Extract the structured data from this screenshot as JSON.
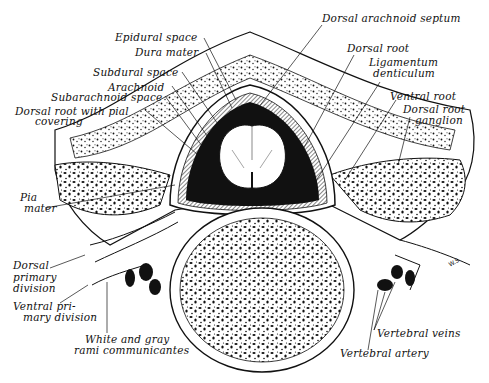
{
  "figure": {
    "signature": "W.S.",
    "colors": {
      "ink": "#111111",
      "paper": "#ffffff"
    }
  },
  "labels": {
    "epidural_space": "Epidural space",
    "dura_mater": "Dura mater",
    "subdural_space": "Subdural space",
    "arachnoid": "Arachnoid",
    "subarachnoid_space": "Subarachnoid space",
    "dorsal_root_pial_1": "Dorsal root with pial",
    "dorsal_root_pial_2": "covering",
    "pia_mater_1": "Pia",
    "pia_mater_2": "mater",
    "dorsal_primary_1": "Dorsal",
    "dorsal_primary_2": "primary",
    "dorsal_primary_3": "division",
    "ventral_primary_1": "Ventral pri-",
    "ventral_primary_2": "mary division",
    "rami_1": "White and gray",
    "rami_2": "rami communicantes",
    "dorsal_arachnoid_septum": "Dorsal arachnoid septum",
    "dorsal_root": "Dorsal root",
    "ligamentum_1": "Ligamentum",
    "ligamentum_2": "denticulum",
    "ventral_root": "Ventral root",
    "drg_1": "Dorsal root",
    "drg_2": "ganglion",
    "vertebral_veins": "Vertebral veins",
    "vertebral_artery": "Vertebral artery"
  }
}
